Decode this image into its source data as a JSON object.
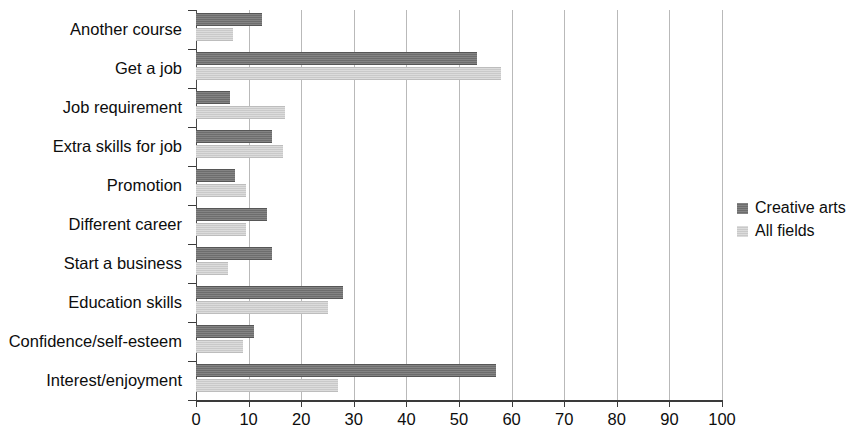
{
  "chart_data": {
    "type": "bar",
    "orientation": "horizontal",
    "title": "",
    "xlabel": "",
    "ylabel": "",
    "xlim": [
      0,
      100
    ],
    "xticks": [
      0,
      10,
      20,
      30,
      40,
      50,
      60,
      70,
      80,
      90,
      100
    ],
    "grid": true,
    "grid_axis": "x",
    "legend_position": "right",
    "categories": [
      "Another course",
      "Get a job",
      "Job requirement",
      "Extra skills for job",
      "Promotion",
      "Different career",
      "Start a business",
      "Education skills",
      "Confidence/self-esteem",
      "Interest/enjoyment"
    ],
    "series": [
      {
        "name": "Creative arts",
        "color": "#6d6d6d",
        "values": [
          12.5,
          53.5,
          6.5,
          14.5,
          7.5,
          13.5,
          14.5,
          28,
          11,
          57
        ]
      },
      {
        "name": "All fields",
        "color": "#c9c9c9",
        "values": [
          7,
          58,
          17,
          16.5,
          9.5,
          9.5,
          6,
          25,
          9,
          27
        ]
      }
    ]
  },
  "legend": {
    "items": [
      {
        "label": "Creative arts",
        "swatch": "dark"
      },
      {
        "label": "All fields",
        "swatch": "light"
      }
    ]
  }
}
